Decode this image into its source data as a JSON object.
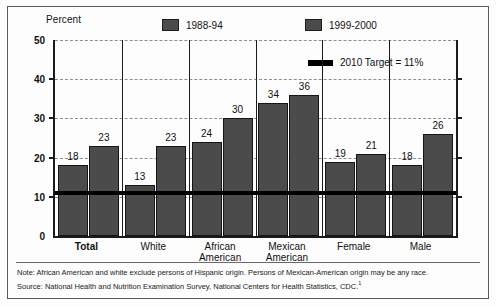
{
  "axis": {
    "y_title": "Percent",
    "y_ticks": [
      "0",
      "10",
      "20",
      "30",
      "40",
      "50"
    ]
  },
  "legend": {
    "series1_label": "1988-94",
    "series2_label": "1999-2000",
    "target_label": "2010 Target = 11%"
  },
  "footnotes": {
    "note": "Note: African American and white exclude persons of Hispanic origin. Persons of Mexican-American origin may be any race.",
    "source": "Source: National Health and Nutrition Examination Survey, National Centers for Health Statistics, CDC.",
    "source_superscript": "1"
  },
  "chart_data": {
    "type": "bar",
    "title": "",
    "xlabel": "",
    "ylabel": "Percent",
    "ylim": [
      0,
      50
    ],
    "yticks": [
      0,
      10,
      20,
      30,
      40,
      50
    ],
    "grid": true,
    "legend_position": "top",
    "categories": [
      "Total",
      "White",
      "African American",
      "Mexican American",
      "Female",
      "Male"
    ],
    "series": [
      {
        "name": "1988-94",
        "values": [
          18,
          13,
          24,
          34,
          19,
          18
        ]
      },
      {
        "name": "1999-2000",
        "values": [
          23,
          23,
          30,
          36,
          21,
          26
        ]
      }
    ],
    "reference_line": {
      "label": "2010 Target = 11%",
      "value": 11,
      "color": "#000000"
    },
    "bar_color": "#4b4b4b"
  }
}
